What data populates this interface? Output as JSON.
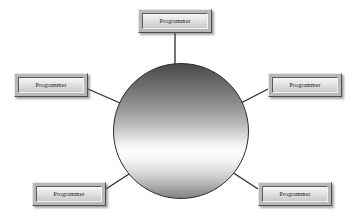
{
  "diagram": {
    "background_color": "#ffffff",
    "line_color": "#2b2b2b",
    "hub": {
      "name": "central-hub",
      "shape": "circle",
      "label": "",
      "center_x": 181,
      "center_y": 131,
      "radius": 68,
      "fill": "vertical-gradient-gray",
      "border_color": "#2b2b2b"
    },
    "nodes": [
      {
        "id": "programmer-top",
        "label": "Programmer",
        "position": "top",
        "x": 138,
        "y": 9,
        "width": 74,
        "height": 24
      },
      {
        "id": "programmer-left",
        "label": "Programmer",
        "position": "left",
        "x": 14,
        "y": 73,
        "width": 74,
        "height": 24
      },
      {
        "id": "programmer-right",
        "label": "Programmer",
        "position": "right",
        "x": 268,
        "y": 73,
        "width": 74,
        "height": 24
      },
      {
        "id": "programmer-bottom-left",
        "label": "Programmer",
        "position": "bottom-left",
        "x": 32,
        "y": 182,
        "width": 74,
        "height": 24
      },
      {
        "id": "programmer-bottom-right",
        "label": "Programmer",
        "position": "bottom-right",
        "x": 258,
        "y": 182,
        "width": 74,
        "height": 24
      }
    ],
    "connectors": [
      {
        "id": "link-top",
        "from": "programmer-top",
        "to": "central-hub",
        "x1": 175,
        "y1": 33,
        "x2": 175,
        "y2": 67
      },
      {
        "id": "link-left",
        "from": "programmer-left",
        "to": "central-hub",
        "x1": 88,
        "y1": 89,
        "x2": 120,
        "y2": 103
      },
      {
        "id": "link-right",
        "from": "programmer-right",
        "to": "central-hub",
        "x1": 268,
        "y1": 89,
        "x2": 241,
        "y2": 103
      },
      {
        "id": "link-bottom-left",
        "from": "programmer-bottom-left",
        "to": "central-hub",
        "x1": 106,
        "y1": 189,
        "x2": 132,
        "y2": 172
      },
      {
        "id": "link-bottom-right",
        "from": "programmer-bottom-right",
        "to": "central-hub",
        "x1": 258,
        "y1": 189,
        "x2": 232,
        "y2": 172
      }
    ]
  }
}
